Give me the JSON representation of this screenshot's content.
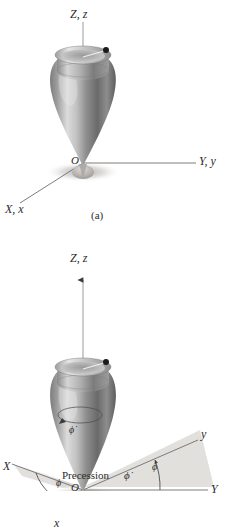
{
  "figure": {
    "panels": [
      {
        "id": "a",
        "caption": "(a)",
        "labels": {
          "vertical_axis": "Z, z",
          "right_axis": "Y, y",
          "left_axis": "X, x",
          "origin": "O"
        }
      },
      {
        "id": "b",
        "caption_prefix": "Precession",
        "caption_symbol": "ϕ̇",
        "labels": {
          "vertical_axis": "Z, z",
          "space_axis_right": "Y",
          "body_axis_right": "y",
          "space_axis_left": "X",
          "body_axis_left": "x",
          "origin": "O",
          "angle_right": "ϕ",
          "angle_left": "ϕ",
          "precession_rate": "ϕ̇"
        }
      }
    ]
  },
  "colors": {
    "background": "#ffffff",
    "ink": "#2b2b2b",
    "axis_line": "#6e6e6e",
    "top_highlight": "#e2e2e2",
    "top_midtone": "#9a9a9a",
    "top_shadow": "#4c4c4c",
    "plane_fill": "#d8d5d2",
    "shadow": "#b9b6b3",
    "marker_dot": "#1a1a1a"
  }
}
